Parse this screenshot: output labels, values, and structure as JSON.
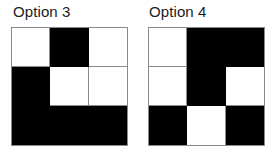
{
  "background_color": "#ffffff",
  "colors": {
    "filled": "#000000",
    "empty": "#ffffff",
    "grid_line": "#8a8a8a",
    "label_text": "#1c1c1c"
  },
  "options": [
    {
      "label": "Option 3",
      "grid": {
        "rows": 3,
        "cols": 3,
        "cells": [
          [
            "empty",
            "filled",
            "empty"
          ],
          [
            "filled",
            "empty",
            "empty"
          ],
          [
            "filled",
            "filled",
            "filled"
          ]
        ]
      }
    },
    {
      "label": "Option 4",
      "grid": {
        "rows": 3,
        "cols": 3,
        "cells": [
          [
            "empty",
            "filled",
            "filled"
          ],
          [
            "empty",
            "filled",
            "empty"
          ],
          [
            "filled",
            "empty",
            "filled"
          ]
        ]
      }
    }
  ]
}
